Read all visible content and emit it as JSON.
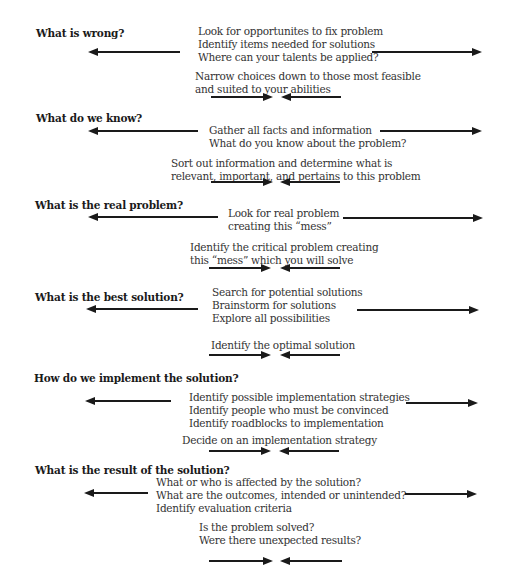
{
  "diagram": {
    "type": "problem-solving-funnel",
    "colors": {
      "background": "#ffffff",
      "heading": "#1a1a1a",
      "text": "#333333",
      "arrow": "#1a1a1a"
    },
    "stages": [
      {
        "heading": "What is wrong?",
        "expand_lines": [
          "Look for opportunites to fix problem",
          "Identify items needed for solutions",
          "Where can your talents be applied?"
        ],
        "converge_lines": [
          "Narrow choices down to those most feasible",
          "and suited to your abilities"
        ]
      },
      {
        "heading": "What do we know?",
        "expand_lines": [
          "Gather all facts and information",
          "What do you know about the problem?"
        ],
        "converge_lines": [
          "Sort out information and determine what is",
          "relevant, important, and pertains to this problem"
        ]
      },
      {
        "heading": "What is the real problem?",
        "expand_lines": [
          "Look for real problem",
          "creating this “mess”"
        ],
        "converge_lines": [
          "Identify the critical problem creating",
          "this “mess” which you will solve"
        ]
      },
      {
        "heading": "What is the best solution?",
        "expand_lines": [
          "Search for potential solutions",
          "Brainstorm for solutions",
          "Explore all possibilities"
        ],
        "converge_lines": [
          "Identify the optimal solution"
        ]
      },
      {
        "heading": "How do we implement the solution?",
        "expand_lines": [
          "Identify possible implementation strategies",
          "Identify people who must be convinced",
          "Identify roadblocks to implementation"
        ],
        "converge_lines": [
          "Decide on an implementation strategy"
        ]
      },
      {
        "heading": "What is the result of the solution?",
        "expand_lines": [
          "What or who is affected by the solution?",
          "What are the outcomes,  intended or unintended?",
          "Identify evaluation criteria"
        ],
        "converge_lines": [
          "Is the problem solved?",
          "Were there unexpected results?"
        ]
      }
    ],
    "arrow_icons": {
      "diverge": "arrows-outward-icon",
      "converge": "arrows-inward-icon"
    }
  }
}
